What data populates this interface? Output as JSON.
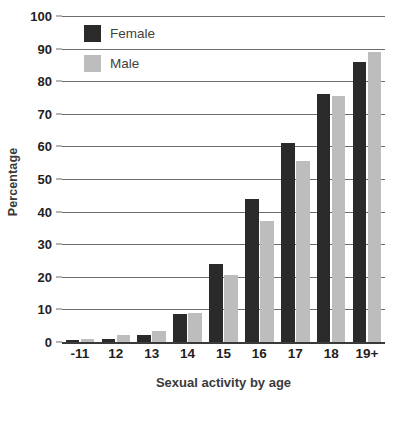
{
  "chart_data": {
    "type": "bar",
    "title": "",
    "xlabel": "Sexual activity by age",
    "ylabel": "Percentage",
    "categories": [
      "-11",
      "12",
      "13",
      "14",
      "15",
      "16",
      "17",
      "18",
      "19+"
    ],
    "series": [
      {
        "name": "Female",
        "color": "#2a2a2a",
        "values": [
          0.5,
          1,
          2,
          8.5,
          24,
          44,
          61,
          76,
          86
        ]
      },
      {
        "name": "Male",
        "color": "#bdbdbd",
        "values": [
          1,
          2,
          3.5,
          9,
          20.5,
          37,
          55.5,
          75.5,
          89
        ]
      }
    ],
    "ylim": [
      0,
      100
    ],
    "yticks": [
      0,
      10,
      20,
      30,
      40,
      50,
      60,
      70,
      80,
      90,
      100
    ],
    "ytick_labels": [
      "0",
      "10",
      "20",
      "30",
      "40",
      "50",
      "60",
      "70",
      "80",
      "90",
      "100"
    ],
    "grid": true,
    "legend_position": "top-left"
  }
}
